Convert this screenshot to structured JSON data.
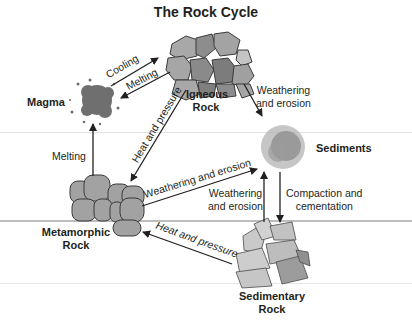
{
  "title": "The Rock Cycle",
  "colors": {
    "background": "#ffffff",
    "text": "#231f20",
    "arrow": "#231f20",
    "rock_fill": "#9a9a9a",
    "rock_fill_light": "#bdbdbd",
    "rock_dark": "#7a7a7a",
    "scanline": "#d8d8d8",
    "scanline_dark": "#b5b5b5"
  },
  "nodes": {
    "igneous": {
      "line1": "Igneous",
      "line2": "Rock"
    },
    "magma": {
      "label": "Magma"
    },
    "sediments": {
      "label": "Sediments"
    },
    "metamorphic": {
      "line1": "Metamorphic",
      "line2": "Rock"
    },
    "sedimentary": {
      "line1": "Sedimentary",
      "line2": "Rock"
    }
  },
  "processes": {
    "cooling": "Cooling",
    "melting_igneous_to_magma": "Melting",
    "igneous_weathering_l1": "Weathering",
    "igneous_weathering_l2": "and erosion",
    "heat_pressure_igneous": "Heat and pressure",
    "melting_metamorphic": "Melting",
    "metamorphic_weathering": "Weathering and erosion",
    "sedimentary_weathering_l1": "Weathering",
    "sedimentary_weathering_l2": "and erosion",
    "compaction_l1": "Compaction and",
    "compaction_l2": "cementation",
    "heat_pressure_sedimentary": "Heat and pressure"
  }
}
